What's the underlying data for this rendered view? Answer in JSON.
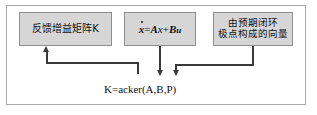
{
  "figure": {
    "frame_border_color": "#a8a8a8",
    "background_color": "#ffffff",
    "node_fill_color": "#d6d6d6",
    "node_border_color": "#8f8f8f",
    "connector_color": "#3a3a3a",
    "text_color": "#101010"
  },
  "nodes": {
    "feedback_gain": {
      "label": "反馈增益矩阵K",
      "name": "feedback-gain-matrix"
    },
    "state_equation": {
      "formula_plain": "ẋ = Ax + Bu",
      "dot_x": "x",
      "equals": "=",
      "term_a": "A",
      "term_x": "x",
      "plus": "+",
      "term_b": "B",
      "term_u": "u"
    },
    "pole_vector": {
      "line1": "由预期闭环",
      "line2": "极点构成的向量"
    }
  },
  "caption": {
    "text": "K=acker(A,B,P)"
  },
  "connectors": [
    {
      "name": "feedback-gain-inbound-arrow",
      "direction": "up"
    },
    {
      "name": "state-equation-outbound-arrow",
      "direction": "down"
    },
    {
      "name": "pole-vector-outbound-arrow",
      "direction": "down"
    }
  ]
}
